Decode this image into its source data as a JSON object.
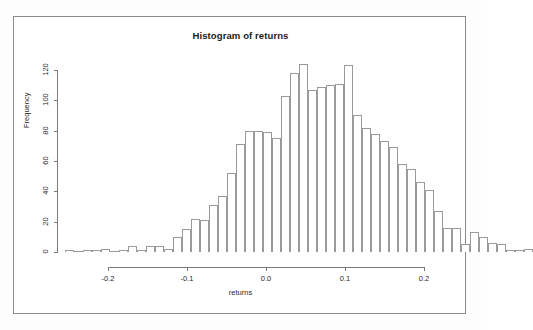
{
  "window": {
    "background_color": "#fdfdfd",
    "frame_color": "#8a8a8a"
  },
  "chart_data": {
    "type": "bar",
    "subtype": "histogram",
    "title": "Histogram of returns",
    "xlabel": "returns",
    "ylabel": "Frequency",
    "grid": false,
    "legend": null,
    "xlim": [
      -0.255,
      0.245
    ],
    "ylim": [
      0,
      128
    ],
    "xticks": [
      -0.2,
      -0.1,
      0.0,
      0.1,
      0.2
    ],
    "xtick_labels": [
      "-0.2",
      "-0.1",
      "0.0",
      "0.1",
      "0.2"
    ],
    "yticks": [
      0,
      20,
      40,
      60,
      80,
      100,
      120
    ],
    "ytick_labels": [
      "0",
      "20",
      "40",
      "60",
      "80",
      "100",
      "120"
    ],
    "bin_width": 0.0114,
    "bin_starts": [
      -0.255,
      -0.2436,
      -0.2322,
      -0.2208,
      -0.2094,
      -0.198,
      -0.1866,
      -0.1752,
      -0.1638,
      -0.1524,
      -0.141,
      -0.1296,
      -0.1182,
      -0.1068,
      -0.0954,
      -0.084,
      -0.0726,
      -0.0612,
      -0.0498,
      -0.0384,
      -0.027,
      -0.0156,
      -0.0042,
      0.0072,
      0.0186,
      0.03,
      0.0414,
      0.0528,
      0.0642,
      0.0756,
      0.087,
      0.0984,
      0.1098,
      0.1212,
      0.1326,
      0.144,
      0.1554,
      0.1668,
      0.1782,
      0.1896,
      0.201,
      0.2124,
      0.2238,
      0.2352
    ],
    "categories": [
      "-0.255",
      "-0.244",
      "-0.232",
      "-0.221",
      "-0.209",
      "-0.198",
      "-0.187",
      "-0.175",
      "-0.164",
      "-0.152",
      "-0.141",
      "-0.130",
      "-0.118",
      "-0.107",
      "-0.095",
      "-0.084",
      "-0.073",
      "-0.061",
      "-0.050",
      "-0.038",
      "-0.027",
      "-0.016",
      "-0.004",
      "0.007",
      "0.019",
      "0.030",
      "0.041",
      "0.053",
      "0.064",
      "0.076",
      "0.087",
      "0.098",
      "0.110",
      "0.121",
      "0.133",
      "0.144",
      "0.155",
      "0.167",
      "0.178",
      "0.190",
      "0.201",
      "0.212",
      "0.224",
      "0.235"
    ],
    "values": [
      1,
      0,
      1,
      1,
      2,
      0,
      1,
      4,
      1,
      4,
      4,
      2,
      10,
      15,
      22,
      21,
      31,
      37,
      52,
      71,
      80,
      80,
      79,
      75,
      103,
      118,
      124,
      107,
      109,
      110,
      111,
      123,
      90,
      82,
      78,
      73,
      69,
      58,
      55,
      46,
      41,
      27,
      16,
      16
    ],
    "extra_tail_values": [
      5,
      13,
      10,
      6,
      5,
      1,
      1,
      2
    ],
    "n_bins": 44
  },
  "geometry": {
    "x_axis_pixel_origin": 266,
    "x_pixels_per_unit": 790,
    "y_axis_pixel_zero": 252,
    "y_pixels_per_unit": 1.5167,
    "bar_pixel_width": 9.0,
    "first_bar_pixel_left": 63
  }
}
